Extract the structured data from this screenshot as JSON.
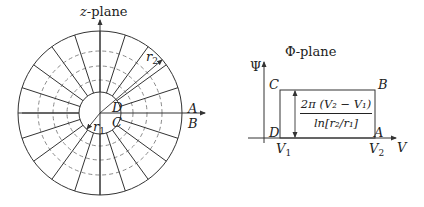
{
  "z_plane": {
    "title_var": "z",
    "title_suffix": "-plane",
    "center": [
      100,
      113
    ],
    "outer_radius": 82,
    "inner_radius": 21,
    "dashed_radii": [
      33,
      47,
      62
    ],
    "spoke_angles_deg": [
      18,
      36,
      54,
      72,
      90,
      108,
      126,
      144,
      162,
      180,
      198,
      216,
      234,
      252,
      270,
      288,
      306,
      324,
      342
    ],
    "labels": {
      "A": "A",
      "B": "B",
      "C": "C",
      "D": "D",
      "r1": "r",
      "r1_sub": "1",
      "r2": "r",
      "r2_sub": "2"
    }
  },
  "phi_plane": {
    "title": "Φ-plane",
    "y_axis_label": "Ψ",
    "x_axis_label": "V",
    "corners": {
      "A": "A",
      "B": "B",
      "C": "C",
      "D": "D"
    },
    "ticks": {
      "v1": "V",
      "v1_sub": "1",
      "v2": "V",
      "v2_sub": "2"
    },
    "height_formula": {
      "numerator": "2π (V₂ − V₁)",
      "denominator": "ln[r₂/r₁]"
    }
  },
  "colors": {
    "line": "#333333",
    "dashed": "#8a8a8a",
    "background": "#ffffff"
  }
}
